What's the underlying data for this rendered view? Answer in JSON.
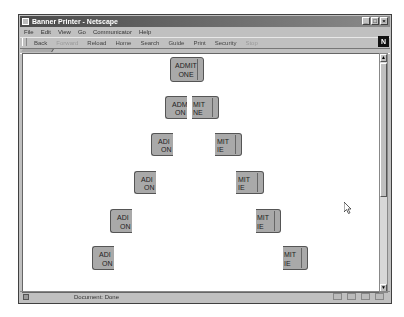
{
  "window": {
    "title": "Banner Printer - Netscape",
    "controls": [
      "minimize",
      "maximize",
      "close"
    ]
  },
  "menubar": {
    "items": [
      "File",
      "Edit",
      "View",
      "Go",
      "Communicator",
      "Help"
    ]
  },
  "toolbar": {
    "buttons": [
      {
        "label": "Back",
        "enabled": true
      },
      {
        "label": "Forward",
        "enabled": false
      },
      {
        "label": "Reload",
        "enabled": true
      },
      {
        "label": "Home",
        "enabled": true
      },
      {
        "label": "Search",
        "enabled": true
      },
      {
        "label": "Guide",
        "enabled": true
      },
      {
        "label": "Print",
        "enabled": true
      },
      {
        "label": "Security",
        "enabled": true
      },
      {
        "label": "Stop",
        "enabled": false
      }
    ],
    "logo": "N"
  },
  "content": {
    "ticket_text": {
      "line1": "ADMIT",
      "line2": "ONE"
    },
    "ticket_left_text": {
      "line1": "ADI",
      "line2": "ON"
    },
    "ticket_right_text": {
      "line1": "MIT",
      "line2": "IE"
    },
    "ticket_row2_left": {
      "line1": "ADM",
      "line2": "ON"
    },
    "ticket_row2_right": {
      "line1": "MIT",
      "line2": "NE"
    }
  },
  "statusbar": {
    "text": "Document: Done"
  },
  "colors": {
    "ticket_fill": "#a9a9a9",
    "page_bg": "#ffffff",
    "chrome": "#c0c0c0"
  }
}
